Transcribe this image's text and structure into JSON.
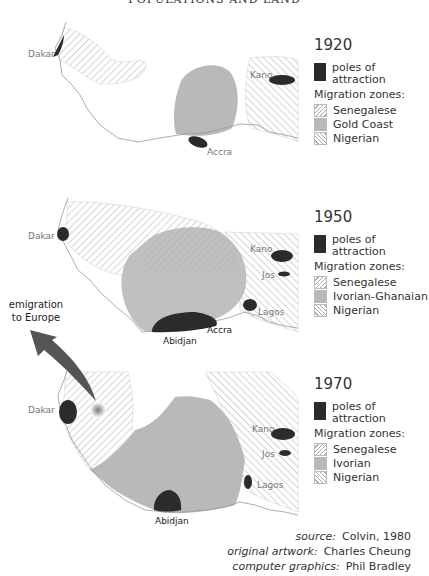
{
  "header": "POPULATIONS AND LAND",
  "maps": [
    {
      "year": "1920",
      "legend": {
        "poles_label": "poles of attraction",
        "zones_title": "Migration zones:",
        "zones": [
          "Senegalese",
          "Gold Coast",
          "Nigerian"
        ]
      },
      "cities": [
        "Dakar",
        "Accra",
        "Kano"
      ]
    },
    {
      "year": "1950",
      "legend": {
        "poles_label": "poles of attraction",
        "zones_title": "Migration zones:",
        "zones": [
          "Senegalese",
          "Ivorian-Ghanaian",
          "Nigerian"
        ]
      },
      "cities": [
        "Dakar",
        "Kano",
        "Jos",
        "Lagos",
        "Accra",
        "Abidjan"
      ]
    },
    {
      "year": "1970",
      "legend": {
        "poles_label": "poles of attraction",
        "zones_title": "Migration zones:",
        "zones": [
          "Senegalese",
          "Ivorian",
          "Nigerian"
        ]
      },
      "cities": [
        "Dakar",
        "Kano",
        "Jos",
        "Lagos",
        "Abidjan"
      ]
    }
  ],
  "emigration_label": "emigration to Europe",
  "credits": {
    "source_label": "source:",
    "source_value": "Colvin, 1980",
    "artwork_label": "original artwork:",
    "artwork_value": "Charles Cheung",
    "graphics_label": "computer graphics:",
    "graphics_value": "Phil Bradley"
  },
  "colors": {
    "pole": "#2b2b2b",
    "zone_fill": "#b9b9b9",
    "hatch": "#aaaaaa",
    "coast": "#999999"
  }
}
